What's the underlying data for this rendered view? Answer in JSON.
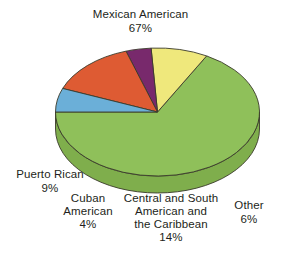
{
  "chart_data": {
    "type": "pie",
    "title": "",
    "three_d": true,
    "legend": "none",
    "labels_position": "outside",
    "unit": "%",
    "categories": [
      "Mexican American",
      "Puerto Rican",
      "Cuban American",
      "Central and South American and the Caribbean",
      "Other"
    ],
    "values": [
      67,
      9,
      4,
      14,
      6
    ],
    "colors": [
      "#8fc05a",
      "#efe87c",
      "#78296c",
      "#de5b33",
      "#6bafd8"
    ],
    "side_colors": [
      "#7fae4c",
      "#e2d56a",
      "#4d1a47",
      "#c74a26",
      "#5b9cc4"
    ],
    "slices": [
      {
        "label": "Mexican American",
        "value": 67,
        "value_text": "67%",
        "color": "#8fc05a"
      },
      {
        "label": "Puerto Rican",
        "value": 9,
        "value_text": "9%",
        "color": "#efe87c"
      },
      {
        "label": "Cuban American",
        "value": 4,
        "value_text": "4%",
        "color": "#78296c"
      },
      {
        "label": "Central and South American and the Caribbean",
        "value": 14,
        "value_text": "14%",
        "color": "#de5b33"
      },
      {
        "label": "Other",
        "value": 6,
        "value_text": "6%",
        "color": "#6bafd8"
      }
    ]
  },
  "labels": {
    "mexican": {
      "line1": "Mexican American",
      "pct": "67%"
    },
    "puerto_rican": {
      "line1": "Puerto Rican",
      "pct": "9%"
    },
    "cuban": {
      "line1": "Cuban",
      "line2": "American",
      "pct": "4%"
    },
    "central": {
      "line1": "Central and South",
      "line2": "American and",
      "line3": "the Caribbean",
      "pct": "14%"
    },
    "other": {
      "line1": "Other",
      "pct": "6%"
    }
  }
}
